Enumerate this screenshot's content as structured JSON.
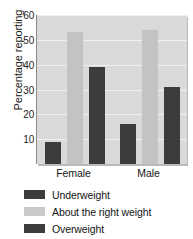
{
  "chart_data": {
    "type": "bar",
    "title": "",
    "xlabel": "",
    "ylabel": "Percentage reporting",
    "categories": [
      "Female",
      "Male"
    ],
    "series": [
      {
        "name": "Underweight",
        "values": [
          9,
          16
        ],
        "color": "#3c3c3c"
      },
      {
        "name": "About the right weight",
        "values": [
          53,
          54
        ],
        "color": "#c3c3c3"
      },
      {
        "name": "Overweight",
        "values": [
          39,
          31
        ],
        "color": "#3c3c3c"
      }
    ],
    "ylim": [
      0,
      60
    ],
    "yticks": [
      10,
      20,
      30,
      40,
      50,
      60
    ],
    "grid": true,
    "legend_position": "bottom-left",
    "plot_background": "#d9d9d9",
    "gridline_color": "#efefef"
  },
  "axis": {
    "y_label": "Percentage reporting",
    "tick_labels": [
      "60",
      "50",
      "40",
      "30",
      "20",
      "10"
    ]
  },
  "x_axis": {
    "labels": [
      "Female",
      "Male"
    ]
  },
  "legend": {
    "items": [
      {
        "label": "Underweight",
        "swatch": "dark"
      },
      {
        "label": "About the right weight",
        "swatch": "light"
      },
      {
        "label": "Overweight",
        "swatch": "dark"
      }
    ]
  }
}
